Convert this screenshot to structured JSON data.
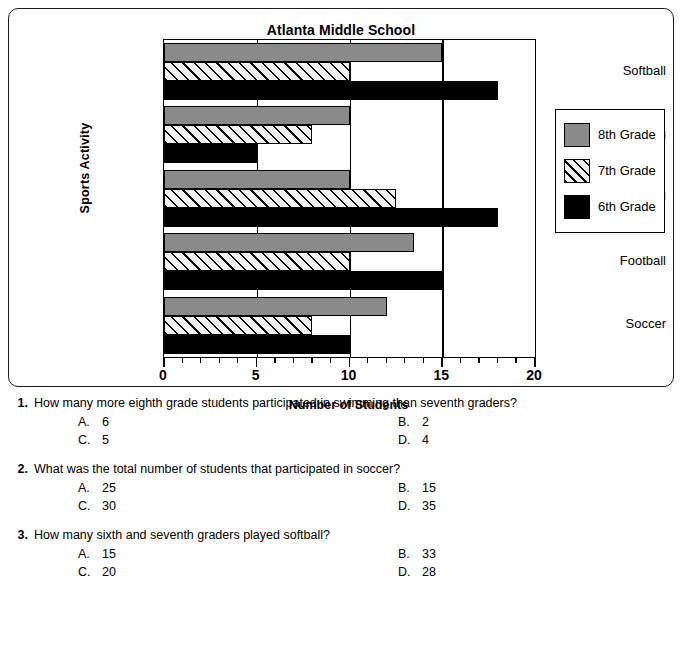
{
  "chart_data": {
    "type": "bar",
    "orientation": "horizontal",
    "title": "Atlanta Middle School",
    "xlabel": "Number of Students",
    "ylabel": "Sports Activity",
    "categories": [
      "Softball",
      "Swimming",
      "Basketball",
      "Football",
      "Soccer"
    ],
    "series": [
      {
        "name": "8th Grade",
        "values": [
          15,
          10,
          10,
          13.5,
          12
        ],
        "color": "#8a8a8a",
        "fill": "solid-gray"
      },
      {
        "name": "7th Grade",
        "values": [
          10,
          8,
          12.5,
          10,
          8
        ],
        "color": "#ffffff",
        "fill": "diagonal-hatch"
      },
      {
        "name": "6th Grade",
        "values": [
          18,
          5,
          18,
          15,
          10
        ],
        "color": "#000000",
        "fill": "solid-black"
      }
    ],
    "xlim": [
      0,
      20
    ],
    "xticks": [
      0,
      5,
      10,
      15,
      20
    ],
    "xtick_labels": [
      "0",
      "5",
      "10",
      "15",
      "20"
    ],
    "minor_tick_step": 1,
    "grid": "vertical",
    "legend_position": "right"
  },
  "chart": {
    "title": "Atlanta Middle School",
    "x_axis_label": "Number of Students",
    "y_axis_label": "Sports Activity",
    "tick_labels": [
      "0",
      "5",
      "10",
      "15",
      "20"
    ],
    "categories": [
      "Softball",
      "Swimming",
      "Basketball",
      "Football",
      "Soccer"
    ],
    "legend": [
      {
        "label": "8th Grade"
      },
      {
        "label": "7th Grade"
      },
      {
        "label": "6th Grade"
      }
    ]
  },
  "questions": [
    {
      "number": "1.",
      "text": "How many more eighth grade students participated in swimming than seventh graders?",
      "choices": [
        {
          "letter": "A.",
          "value": "6"
        },
        {
          "letter": "B.",
          "value": "2"
        },
        {
          "letter": "C.",
          "value": "5"
        },
        {
          "letter": "D.",
          "value": "4"
        }
      ]
    },
    {
      "number": "2.",
      "text": "What was the total number of students that participated in soccer?",
      "choices": [
        {
          "letter": "A.",
          "value": "25"
        },
        {
          "letter": "B.",
          "value": "15"
        },
        {
          "letter": "C.",
          "value": "30"
        },
        {
          "letter": "D.",
          "value": "35"
        }
      ]
    },
    {
      "number": "3.",
      "text": "How many sixth and seventh graders played softball?",
      "choices": [
        {
          "letter": "A.",
          "value": "15"
        },
        {
          "letter": "B.",
          "value": "33"
        },
        {
          "letter": "C.",
          "value": "20"
        },
        {
          "letter": "D.",
          "value": "28"
        }
      ]
    }
  ]
}
